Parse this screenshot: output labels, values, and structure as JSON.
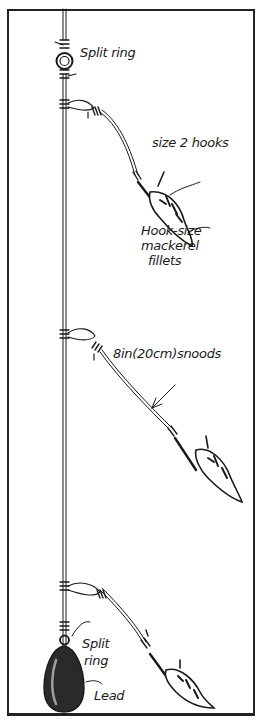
{
  "diagram": {
    "type": "fishing rig illustration",
    "labels": {
      "split_ring_top": "Split ring",
      "hooks": "size 2 hooks",
      "fillets_line1": "Hook-size",
      "fillets_line2": "mackerel",
      "fillets_line3": "fillets",
      "snoods": "8in(20cm)snoods",
      "split_ring_bottom_line1": "Split",
      "split_ring_bottom_line2": "ring",
      "lead": "Lead"
    },
    "colors": {
      "ink": "#1a1a1a",
      "background": "#ffffff"
    }
  }
}
